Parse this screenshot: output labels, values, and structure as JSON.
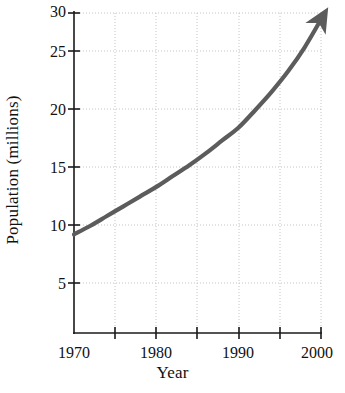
{
  "chart_data": {
    "type": "line",
    "title": "",
    "subtitle": "",
    "xlabel": "Year",
    "ylabel": "Population (millions)",
    "xlim": [
      1968,
      2001
    ],
    "ylim": [
      0,
      30
    ],
    "grid": true,
    "legend": null,
    "legend_position": "none",
    "series_color": "#5c5c5c",
    "axis_color": "#1a1a1a",
    "grid_color": "#c8c8c8",
    "x_ticks_major": [
      1970,
      1980,
      1990,
      2000
    ],
    "x_tick_labels": [
      "1970",
      "1980",
      "1990",
      "2000"
    ],
    "x_ticks_minor": [
      1975,
      1985,
      1995
    ],
    "y_ticks_major": [
      5,
      10,
      15,
      20,
      25,
      30
    ],
    "y_tick_labels": [
      "5",
      "10",
      "15",
      "20",
      "25",
      "30"
    ],
    "annotations": [
      "arrowhead at end of curve pointing up-right"
    ],
    "series": [
      {
        "name": "Population",
        "x": [
          1970,
          1972,
          1974,
          1976,
          1978,
          1980,
          1982,
          1984,
          1986,
          1988,
          1990,
          1992,
          1994,
          1996,
          1998,
          2000
        ],
        "values": [
          9.5,
          10.3,
          11.2,
          12.1,
          13.0,
          13.9,
          14.9,
          15.9,
          17.0,
          18.2,
          19.4,
          21.0,
          22.7,
          24.6,
          26.8,
          29.4
        ]
      }
    ]
  },
  "figure": {
    "ylabel_text": "Population (millions)",
    "xlabel_text": "Year",
    "ytick_0": "5",
    "ytick_1": "10",
    "ytick_2": "15",
    "ytick_3": "20",
    "ytick_4": "25",
    "ytick_5": "30",
    "xtick_0": "1970",
    "xtick_1": "1980",
    "xtick_2": "1990",
    "xtick_3": "2000"
  }
}
